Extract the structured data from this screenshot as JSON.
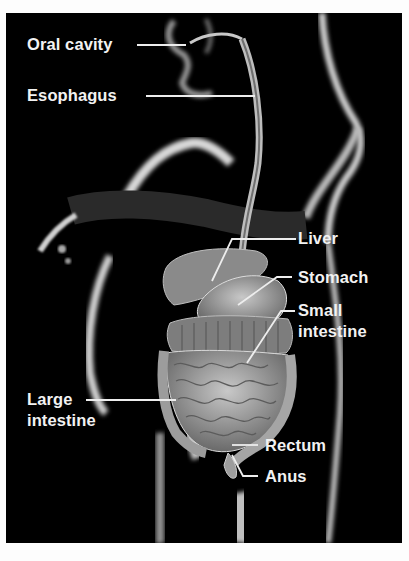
{
  "figure": {
    "background_color": "#000000",
    "label_color": "#f2f2f2",
    "labels": [
      {
        "id": "oral-cavity",
        "text": "Oral cavity"
      },
      {
        "id": "esophagus",
        "text": "Esophagus"
      },
      {
        "id": "liver",
        "text": "Liver"
      },
      {
        "id": "stomach",
        "text": "Stomach"
      },
      {
        "id": "small-intestine",
        "line1": "Small",
        "line2": "intestine"
      },
      {
        "id": "large-intestine",
        "line1": "Large",
        "line2": "intestine"
      },
      {
        "id": "rectum",
        "text": "Rectum"
      },
      {
        "id": "anus",
        "text": "Anus"
      }
    ]
  }
}
